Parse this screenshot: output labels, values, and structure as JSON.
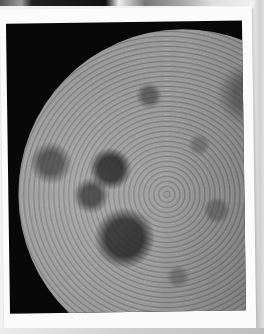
{
  "scene": {
    "description": "Photograph of a printed photo of the Moon's cratered surface with a white border, laid on a white surface",
    "subject": "moon",
    "colors": {
      "background": "#f2f2f2",
      "print_border": "#fbfbfb",
      "space": "#080808",
      "moon_light": "#c8c8c8",
      "moon_dark": "#2a2a2a"
    }
  }
}
